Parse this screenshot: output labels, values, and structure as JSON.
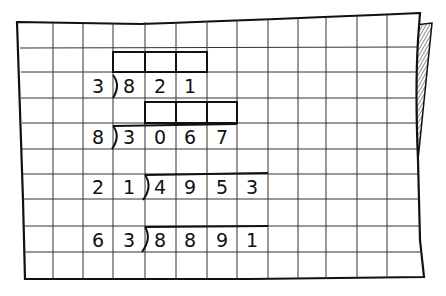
{
  "worksheet": {
    "description": "Hand-drawn grid paper with long division problems",
    "problems": [
      {
        "divisor": "3",
        "dividend": "821",
        "answer_boxes": 3
      },
      {
        "divisor": "8",
        "dividend": "3067",
        "answer_boxes": 3
      },
      {
        "divisor": "21",
        "dividend": "4953",
        "answer_boxes": 0
      },
      {
        "divisor": "63",
        "dividend": "8891",
        "answer_boxes": 0
      }
    ],
    "cells": {
      "p1_divisor": "3",
      "p1_d1": "8",
      "p1_d2": "2",
      "p1_d3": "1",
      "p2_divisor": "8",
      "p2_d1": "3",
      "p2_d2": "0",
      "p2_d3": "6",
      "p2_d4": "7",
      "p3_div1": "2",
      "p3_div2": "1",
      "p3_d1": "4",
      "p3_d2": "9",
      "p3_d3": "5",
      "p3_d4": "3",
      "p4_div1": "6",
      "p4_div2": "3",
      "p4_d1": "8",
      "p4_d2": "8",
      "p4_d3": "9",
      "p4_d4": "1"
    },
    "colors": {
      "ink": "#111111",
      "grid": "#333333",
      "paper": "#ffffff"
    }
  }
}
